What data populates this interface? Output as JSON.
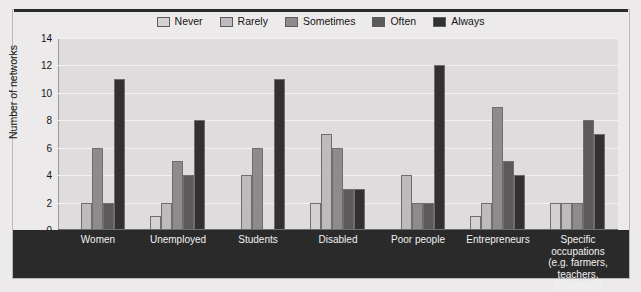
{
  "chart_data": {
    "type": "bar",
    "title": "",
    "subtitle": "",
    "xlabel": "",
    "ylabel": "Number of networks",
    "ylim": [
      0,
      14
    ],
    "ytick_step": 2,
    "yticks": [
      "14",
      "12",
      "10",
      "8",
      "6",
      "4",
      "2",
      "0"
    ],
    "grid": true,
    "legend_position": "top-center",
    "categories": [
      "Women",
      "Unemployed",
      "Students",
      "Disabled",
      "Poor people",
      "Entrepreneurs",
      "Specific occupations (e.g. farmers, teachers, fishermen)"
    ],
    "category_lines": [
      [
        "Women"
      ],
      [
        "Unemployed"
      ],
      [
        "Students"
      ],
      [
        "Disabled"
      ],
      [
        "Poor people"
      ],
      [
        "Entrepreneurs"
      ],
      [
        "Specific",
        "occupations",
        "(e.g. farmers,",
        "teachers, fishermen)"
      ]
    ],
    "series": [
      {
        "name": "Never",
        "color": "#d3d1d1",
        "values": [
          0,
          1,
          0,
          2,
          0,
          1,
          2
        ]
      },
      {
        "name": "Rarely",
        "color": "#bdbbbb",
        "values": [
          2,
          2,
          4,
          7,
          4,
          2,
          2
        ]
      },
      {
        "name": "Sometimes",
        "color": "#8d8b8b",
        "values": [
          6,
          5,
          6,
          6,
          2,
          9,
          2
        ]
      },
      {
        "name": "Often",
        "color": "#5b5959",
        "values": [
          2,
          4,
          0,
          3,
          2,
          5,
          8
        ]
      },
      {
        "name": "Always",
        "color": "#323030",
        "values": [
          11,
          8,
          11,
          3,
          12,
          4,
          7
        ]
      }
    ]
  },
  "colors": {
    "plot_background": "#dedcdc",
    "figure_background": "#eceaea",
    "axis_band": "#2a2a2a",
    "gridline": "#f2f1f1",
    "text": "#141414",
    "axis_text_light": "#f2f2f2"
  }
}
